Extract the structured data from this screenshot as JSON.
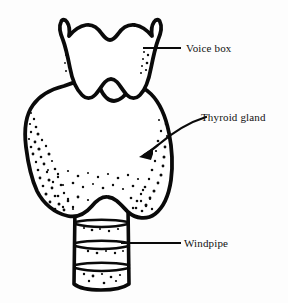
{
  "figure": {
    "background_color": "#fdfdfd",
    "ink_color": "#0a0a0a",
    "style": "black and white line drawing with stipple shading"
  },
  "labels": [
    {
      "id": "voice-box",
      "text": "Voice box",
      "text_x": 186,
      "text_y": 52,
      "leader": {
        "type": "straight-line",
        "from_x": 143,
        "from_y": 48,
        "to_x": 181,
        "to_y": 48
      }
    },
    {
      "id": "thyroid-gland",
      "text": "Thyroid gland",
      "text_x": 201,
      "text_y": 121,
      "leader": {
        "type": "curved-arrow",
        "from_x": 206,
        "from_y": 117,
        "to_x": 141,
        "to_y": 156
      }
    },
    {
      "id": "windpipe",
      "text": "Windpipe",
      "text_x": 184,
      "text_y": 247,
      "leader": {
        "type": "straight-line",
        "from_x": 121,
        "from_y": 243,
        "to_x": 181,
        "to_y": 243
      }
    }
  ],
  "structures": [
    {
      "id": "voice-box-cartilage",
      "name": "Voice box",
      "description": "Shield shaped thyroid cartilage with two upward horns and a central superior notch"
    },
    {
      "id": "thyroid-gland-body",
      "name": "Thyroid gland",
      "description": "Butterfly shaped bilobed gland wrapping the upper windpipe, stipple shaded along lower and lateral margins"
    },
    {
      "id": "windpipe-trachea",
      "name": "Windpipe",
      "description": "Trachea below the gland showing three cartilage ring bands"
    }
  ]
}
